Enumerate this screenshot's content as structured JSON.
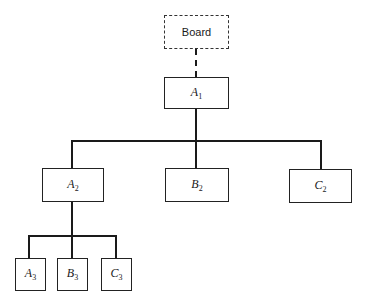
{
  "diagram": {
    "type": "organization-chart",
    "nodes": {
      "board": {
        "label": "Board",
        "style": "dashed"
      },
      "a1": {
        "letter": "A",
        "sub": "1"
      },
      "a2": {
        "letter": "A",
        "sub": "2"
      },
      "b2": {
        "letter": "B",
        "sub": "2"
      },
      "c2": {
        "letter": "C",
        "sub": "2"
      },
      "a3": {
        "letter": "A",
        "sub": "3"
      },
      "b3": {
        "letter": "B",
        "sub": "3"
      },
      "c3": {
        "letter": "C",
        "sub": "3"
      }
    },
    "edges": [
      {
        "from": "Board",
        "to": "A1",
        "style": "dashed"
      },
      {
        "from": "A1",
        "to": "A2",
        "style": "solid"
      },
      {
        "from": "A1",
        "to": "B2",
        "style": "solid"
      },
      {
        "from": "A1",
        "to": "C2",
        "style": "solid"
      },
      {
        "from": "A2",
        "to": "A3",
        "style": "solid"
      },
      {
        "from": "A2",
        "to": "B3",
        "style": "solid"
      },
      {
        "from": "A2",
        "to": "C3",
        "style": "solid"
      }
    ],
    "colors": {
      "line": "#1a1a1a",
      "background": "#ffffff"
    }
  }
}
